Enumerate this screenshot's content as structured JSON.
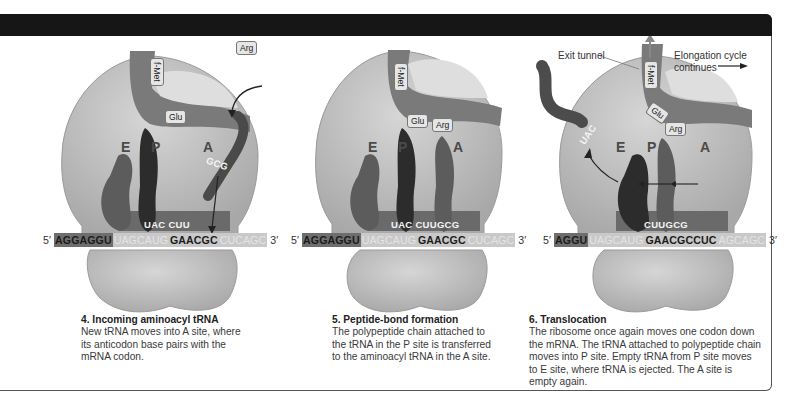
{
  "figure": {
    "banner_color": "#161616",
    "colors": {
      "ribosome": "#c4c4c4",
      "ribosome_shadow": "#a9a9a9",
      "tunnel": "#7a7a7a",
      "trna_dark": "#2c2c2c",
      "trna_mid": "#5c5c5c",
      "mrna_dark_segment": "#6e6e6e",
      "mrna_light_segment": "#c9c9c9"
    }
  },
  "panels": [
    {
      "step": "4. Incoming aminoacyl tRNA",
      "description_lines": [
        "New tRNA moves into A site, where",
        "its anticodon base pairs with the",
        "mRNA codon."
      ],
      "sites": [
        "E",
        "P",
        "A"
      ],
      "amino_acids": {
        "chain_top": "f-Met",
        "chain_mid": "Glu",
        "incoming": "Arg"
      },
      "anticodons": {
        "bound": "UAC CUU",
        "incoming": "GCG"
      },
      "mrna": {
        "five_prime": "5′",
        "three_prime": "3′",
        "dark": "AGGAGGU",
        "light1": "UAGCAUG",
        "bold": "GAACGC",
        "light2": "CUCAGC"
      }
    },
    {
      "step": "5. Peptide-bond formation",
      "description_lines": [
        "The polypeptide chain attached to",
        "the tRNA in the P site is transferred",
        "to the aminoacyl tRNA in the A site."
      ],
      "sites": [
        "E",
        "P",
        "A"
      ],
      "amino_acids": {
        "chain_top": "f-Met",
        "chain_mid": "Glu",
        "chain_end": "Arg"
      },
      "anticodons": {
        "bound": "UAC CUUGCG"
      },
      "mrna": {
        "five_prime": "5′",
        "three_prime": "3′",
        "dark": "AGGAGGU",
        "light1": "UAGCAUG",
        "bold": "GAACGC",
        "light2": "CUCAGC"
      }
    },
    {
      "step": "6. Translocation",
      "description_lines": [
        "The ribosome once again moves one codon down",
        "the mRNA. The tRNA attached to polypeptide chain",
        "moves into P site. Empty tRNA from P site moves",
        "to E site, where tRNA is ejected. The A site is",
        "empty again."
      ],
      "sites": [
        "E",
        "P",
        "A"
      ],
      "amino_acids": {
        "chain_top": "f-Met",
        "chain_mid": "Glu",
        "chain_end": "Arg"
      },
      "anticodons": {
        "bound": "CUUGCG",
        "ejected": "UAC"
      },
      "labels": {
        "exit_tunnel": "Exit tunnel",
        "elongation_line1": "Elongation cycle",
        "elongation_line2": "continues"
      },
      "mrna": {
        "five_prime": "5′",
        "three_prime": "3′",
        "dark": "AGGU",
        "light1": "UAGCAUG",
        "bold": "GAACGCCUC",
        "light2": "AGCAGC"
      }
    }
  ]
}
